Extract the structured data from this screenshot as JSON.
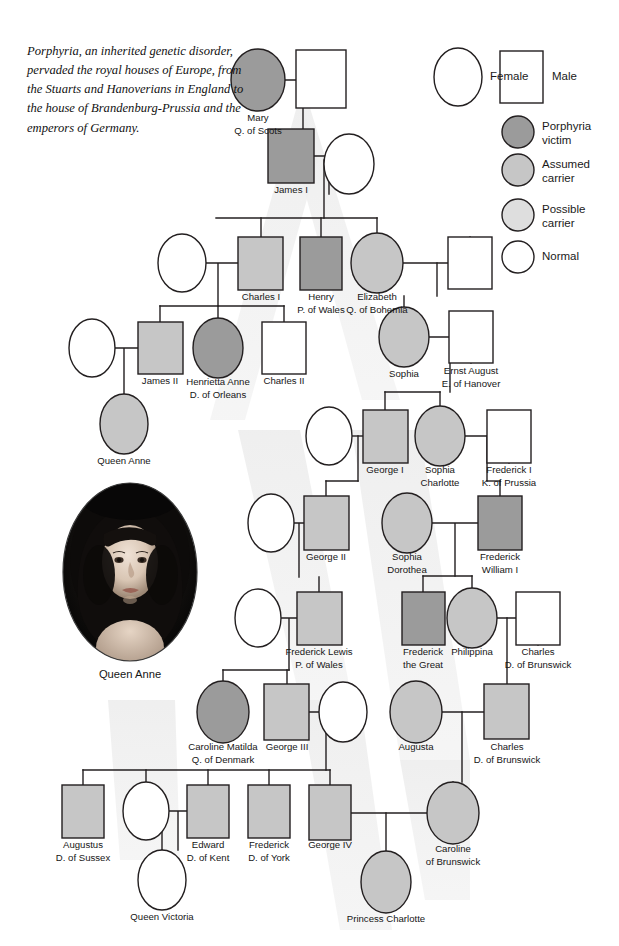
{
  "intro": {
    "text": "Porphyria, an inherited genetic disorder, pervaded the royal houses of Europe, from the Stuarts and Hanoverians in England to the house of Brandenburg-Prussia and the emperors of Germany."
  },
  "legend": {
    "shape_items": [
      {
        "key": "female",
        "label": "Female",
        "shape": "ellipse",
        "fill": "#ffffff"
      },
      {
        "key": "male",
        "label": "Male",
        "shape": "rect",
        "fill": "#ffffff"
      }
    ],
    "status_items": [
      {
        "key": "porphyria-victim",
        "label": "Porphyria\nvictim",
        "fill": "#9b9b9b"
      },
      {
        "key": "assumed-carrier",
        "label": "Assumed\ncarrier",
        "fill": "#c6c6c6"
      },
      {
        "key": "possible-carrier",
        "label": "Possible\ncarrier",
        "fill": "#dedede"
      },
      {
        "key": "normal",
        "label": "Normal",
        "fill": "#ffffff"
      }
    ]
  },
  "colors": {
    "victim": "#9b9b9b",
    "assumed_carrier": "#c6c6c6",
    "possible_carrier": "#dedede",
    "normal": "#ffffff",
    "stroke": "#231f20",
    "watermark": "#eeeeee",
    "text": "#161616"
  },
  "portrait": {
    "name": "queen-anne-portrait",
    "caption": "Queen Anne"
  },
  "people": [
    {
      "id": "mary-q-of-scots",
      "label": "Mary\nQ. of Scots",
      "sex": "female",
      "status": "victim",
      "cx": 258,
      "cy": 80,
      "rx": 27,
      "ry": 31,
      "lx": 258,
      "ly": 112
    },
    {
      "id": "mary-spouse",
      "label": "",
      "sex": "male",
      "status": "normal",
      "x": 296,
      "y": 50,
      "w": 50,
      "h": 58,
      "lx": 321,
      "ly": 110
    },
    {
      "id": "james-i",
      "label": "James I",
      "sex": "male",
      "status": "victim",
      "x": 268,
      "y": 129,
      "w": 46,
      "h": 54,
      "lx": 291,
      "ly": 184
    },
    {
      "id": "james-i-spouse",
      "label": "",
      "sex": "female",
      "status": "normal",
      "cx": 349,
      "cy": 164,
      "rx": 25,
      "ry": 30,
      "lx": 349,
      "ly": 195
    },
    {
      "id": "charles-i",
      "label": "Charles I",
      "sex": "male",
      "status": "assumed_carrier",
      "x": 238,
      "y": 237,
      "w": 45,
      "h": 53,
      "lx": 261,
      "ly": 291
    },
    {
      "id": "charles-i-spouse",
      "label": "",
      "sex": "female",
      "status": "normal",
      "cx": 182,
      "cy": 263,
      "rx": 24,
      "ry": 29,
      "lx": 182,
      "ly": 293
    },
    {
      "id": "henry-p-of-wales",
      "label": "Henry\nP. of Wales",
      "sex": "male",
      "status": "victim",
      "x": 300,
      "y": 237,
      "w": 42,
      "h": 53,
      "lx": 321,
      "ly": 291
    },
    {
      "id": "elizabeth-q-of-bohemia",
      "label": "Elizabeth\nQ. of Bohemia",
      "sex": "female",
      "status": "assumed_carrier",
      "cx": 377,
      "cy": 263,
      "rx": 26,
      "ry": 30,
      "lx": 377,
      "ly": 291
    },
    {
      "id": "elizabeth-spouse",
      "label": "",
      "sex": "male",
      "status": "normal",
      "x": 448,
      "y": 237,
      "w": 44,
      "h": 52,
      "lx": 470,
      "ly": 291
    },
    {
      "id": "james-ii",
      "label": "James II",
      "sex": "male",
      "status": "assumed_carrier",
      "x": 138,
      "y": 322,
      "w": 45,
      "h": 52,
      "lx": 160,
      "ly": 375
    },
    {
      "id": "james-ii-spouse",
      "label": "",
      "sex": "female",
      "status": "normal",
      "cx": 92,
      "cy": 348,
      "rx": 23,
      "ry": 29,
      "lx": 92,
      "ly": 378
    },
    {
      "id": "henrietta-anne-d-of-orleans",
      "label": "Henrietta Anne\nD. of Orleans",
      "sex": "female",
      "status": "victim",
      "cx": 218,
      "cy": 348,
      "rx": 25,
      "ry": 30,
      "lx": 218,
      "ly": 376
    },
    {
      "id": "charles-ii",
      "label": "Charles II",
      "sex": "male",
      "status": "normal",
      "x": 262,
      "y": 322,
      "w": 44,
      "h": 52,
      "lx": 284,
      "ly": 375
    },
    {
      "id": "queen-anne",
      "label": "Queen Anne",
      "sex": "female",
      "status": "assumed_carrier",
      "cx": 124,
      "cy": 424,
      "rx": 24,
      "ry": 30,
      "lx": 124,
      "ly": 455
    },
    {
      "id": "sophia",
      "label": "Sophia",
      "sex": "female",
      "status": "assumed_carrier",
      "cx": 404,
      "cy": 337,
      "rx": 25,
      "ry": 30,
      "lx": 404,
      "ly": 368
    },
    {
      "id": "ernst-august-e-of-hanover",
      "label": "Ernst August\nE. of Hanover",
      "sex": "male",
      "status": "normal",
      "x": 449,
      "y": 311,
      "w": 44,
      "h": 52,
      "lx": 471,
      "ly": 365
    },
    {
      "id": "george-i",
      "label": "George I",
      "sex": "male",
      "status": "assumed_carrier",
      "x": 363,
      "y": 410,
      "w": 45,
      "h": 53,
      "lx": 385,
      "ly": 464
    },
    {
      "id": "george-i-spouse",
      "label": "",
      "sex": "female",
      "status": "normal",
      "cx": 329,
      "cy": 436,
      "rx": 23,
      "ry": 29,
      "lx": 329,
      "ly": 466
    },
    {
      "id": "sophia-charlotte",
      "label": "Sophia\nCharlotte",
      "sex": "female",
      "status": "assumed_carrier",
      "cx": 440,
      "cy": 436,
      "rx": 25,
      "ry": 30,
      "lx": 440,
      "ly": 464
    },
    {
      "id": "frederick-i-k-of-prussia",
      "label": "Frederick I\nK. of Prussia",
      "sex": "male",
      "status": "normal",
      "x": 487,
      "y": 410,
      "w": 44,
      "h": 53,
      "lx": 509,
      "ly": 464
    },
    {
      "id": "george-ii",
      "label": "George II",
      "sex": "male",
      "status": "assumed_carrier",
      "x": 304,
      "y": 496,
      "w": 45,
      "h": 54,
      "lx": 326,
      "ly": 551
    },
    {
      "id": "george-ii-spouse",
      "label": "",
      "sex": "female",
      "status": "normal",
      "cx": 271,
      "cy": 523,
      "rx": 23,
      "ry": 29,
      "lx": 271,
      "ly": 553
    },
    {
      "id": "sophia-dorothea",
      "label": "Sophia\nDorothea",
      "sex": "female",
      "status": "assumed_carrier",
      "cx": 407,
      "cy": 523,
      "rx": 25,
      "ry": 30,
      "lx": 407,
      "ly": 551
    },
    {
      "id": "frederick-william-i",
      "label": "Frederick\nWilliam I",
      "sex": "male",
      "status": "victim",
      "x": 478,
      "y": 496,
      "w": 44,
      "h": 54,
      "lx": 500,
      "ly": 551
    },
    {
      "id": "frederick-lewis-p-of-wales",
      "label": "Frederick Lewis\nP. of Wales",
      "sex": "male",
      "status": "assumed_carrier",
      "x": 297,
      "y": 592,
      "w": 45,
      "h": 53,
      "lx": 319,
      "ly": 646
    },
    {
      "id": "frederick-lewis-spouse",
      "label": "",
      "sex": "female",
      "status": "normal",
      "cx": 258,
      "cy": 618,
      "rx": 23,
      "ry": 29,
      "lx": 258,
      "ly": 648
    },
    {
      "id": "frederick-the-great",
      "label": "Frederick\nthe Great",
      "sex": "male",
      "status": "victim",
      "x": 402,
      "y": 592,
      "w": 43,
      "h": 53,
      "lx": 423,
      "ly": 646
    },
    {
      "id": "philippina",
      "label": "Philippina",
      "sex": "female",
      "status": "assumed_carrier",
      "cx": 472,
      "cy": 618,
      "rx": 25,
      "ry": 30,
      "lx": 472,
      "ly": 646
    },
    {
      "id": "charles-d-of-brunswick-sr",
      "label": "Charles\nD. of Brunswick",
      "sex": "male",
      "status": "normal",
      "x": 516,
      "y": 592,
      "w": 44,
      "h": 53,
      "lx": 538,
      "ly": 646
    },
    {
      "id": "caroline-matilda-q-of-denmark",
      "label": "Caroline Matilda\nQ. of Denmark",
      "sex": "female",
      "status": "victim",
      "cx": 223,
      "cy": 712,
      "rx": 26,
      "ry": 31,
      "lx": 223,
      "ly": 741
    },
    {
      "id": "george-iii",
      "label": "George III",
      "sex": "male",
      "status": "assumed_carrier",
      "x": 264,
      "y": 684,
      "w": 45,
      "h": 56,
      "lx": 287,
      "ly": 741
    },
    {
      "id": "george-iii-spouse",
      "label": "",
      "sex": "female",
      "status": "normal",
      "cx": 343,
      "cy": 712,
      "rx": 24,
      "ry": 30,
      "lx": 343,
      "ly": 743
    },
    {
      "id": "augusta",
      "label": "Augusta",
      "sex": "female",
      "status": "assumed_carrier",
      "cx": 416,
      "cy": 712,
      "rx": 26,
      "ry": 31,
      "lx": 416,
      "ly": 741
    },
    {
      "id": "charles-d-of-brunswick-jr",
      "label": "Charles\nD. of Brunswick",
      "sex": "male",
      "status": "assumed_carrier",
      "x": 484,
      "y": 684,
      "w": 45,
      "h": 55,
      "lx": 507,
      "ly": 741
    },
    {
      "id": "augustus-d-of-sussex",
      "label": "Augustus\nD. of Sussex",
      "sex": "male",
      "status": "assumed_carrier",
      "x": 62,
      "y": 785,
      "w": 42,
      "h": 53,
      "lx": 83,
      "ly": 839
    },
    {
      "id": "edward-d-of-kent-spouse",
      "label": "",
      "sex": "female",
      "status": "normal",
      "cx": 146,
      "cy": 811,
      "rx": 23,
      "ry": 29,
      "lx": 146,
      "ly": 842
    },
    {
      "id": "edward-d-of-kent",
      "label": "Edward\nD. of Kent",
      "sex": "male",
      "status": "assumed_carrier",
      "x": 187,
      "y": 785,
      "w": 42,
      "h": 53,
      "lx": 208,
      "ly": 839
    },
    {
      "id": "frederick-d-of-york",
      "label": "Frederick\nD. of York",
      "sex": "male",
      "status": "assumed_carrier",
      "x": 248,
      "y": 785,
      "w": 42,
      "h": 53,
      "lx": 269,
      "ly": 839
    },
    {
      "id": "george-iv",
      "label": "George IV",
      "sex": "male",
      "status": "assumed_carrier",
      "x": 309,
      "y": 785,
      "w": 42,
      "h": 55,
      "lx": 330,
      "ly": 839
    },
    {
      "id": "caroline-of-brunswick",
      "label": "Caroline\nof Brunswick",
      "sex": "female",
      "status": "assumed_carrier",
      "cx": 453,
      "cy": 813,
      "rx": 26,
      "ry": 31,
      "lx": 453,
      "ly": 843
    },
    {
      "id": "queen-victoria",
      "label": "Queen Victoria",
      "sex": "female",
      "status": "normal",
      "cx": 162,
      "cy": 880,
      "rx": 24,
      "ry": 30,
      "lx": 162,
      "ly": 911
    },
    {
      "id": "princess-charlotte",
      "label": "Princess Charlotte",
      "sex": "female",
      "status": "assumed_carrier",
      "cx": 386,
      "cy": 882,
      "rx": 25,
      "ry": 31,
      "lx": 386,
      "ly": 913
    }
  ],
  "links": [
    {
      "id": "mary-union",
      "d": "M285 80 H321 M321 80 V55"
    },
    {
      "id": "mary-to-james-i",
      "d": "M303 80 V129"
    },
    {
      "id": "james-i-union",
      "d": "M314 156 H329 M329 156 V194"
    },
    {
      "id": "james-i-children-drop",
      "d": "M324 160 V218"
    },
    {
      "id": "gen3-sibship",
      "d": "M216 218 H377"
    },
    {
      "id": "charles-i-stem",
      "d": "M261 218 V237"
    },
    {
      "id": "henry-stem",
      "d": "M321 218 V237"
    },
    {
      "id": "elizabeth-stem",
      "d": "M377 218 V233"
    },
    {
      "id": "charles-i-union",
      "d": "M206 263 H238 M218 263 V306"
    },
    {
      "id": "elizabeth-union",
      "d": "M403 263 H470 M470 263 V237"
    },
    {
      "id": "elizabeth-children-drop",
      "d": "M437 263 V296"
    },
    {
      "id": "sophia-stem",
      "d": "M404 296 V307"
    },
    {
      "id": "gen4-sibship",
      "d": "M160 306 H284"
    },
    {
      "id": "james-ii-stem",
      "d": "M160 306 V322"
    },
    {
      "id": "henrietta-stem",
      "d": "M218 306 V318"
    },
    {
      "id": "charles-ii-stem",
      "d": "M284 306 V322"
    },
    {
      "id": "james-ii-union",
      "d": "M115 348 H138 M124 348 V394"
    },
    {
      "id": "sophia-union",
      "d": "M429 337 H471 M471 337 V363"
    },
    {
      "id": "sophia-children-drop",
      "d": "M450 337 V392"
    },
    {
      "id": "gen5-sibship",
      "d": "M385 392 H440"
    },
    {
      "id": "george-i-stem",
      "d": "M385 392 V410"
    },
    {
      "id": "sophia-charlotte-stem",
      "d": "M440 392 V406"
    },
    {
      "id": "george-i-union",
      "d": "M352 436 H363"
    },
    {
      "id": "george-i-children-drop",
      "d": "M358 436 V481"
    },
    {
      "id": "sophia-charlotte-union",
      "d": "M465 436 H509 M509 436 V463"
    },
    {
      "id": "sc-children-drop",
      "d": "M487 436 V481"
    },
    {
      "id": "george-ii-stem",
      "d": "M326 481 V496"
    },
    {
      "id": "george-ii-sib",
      "d": "M326 481 H358"
    },
    {
      "id": "fw1-stem",
      "d": "M500 481 V496"
    },
    {
      "id": "fw1-sib",
      "d": "M487 481 H500"
    },
    {
      "id": "george-ii-union",
      "d": "M294 523 H304 M299 523 V577"
    },
    {
      "id": "fw1-union",
      "d": "M432 523 H478 M455 523 V576"
    },
    {
      "id": "gen7-prussia-sibship",
      "d": "M423 576 H472"
    },
    {
      "id": "frederick-great-stem",
      "d": "M423 576 V592"
    },
    {
      "id": "philippina-stem",
      "d": "M472 576 V588"
    },
    {
      "id": "frederick-lewis-stem",
      "d": "M319 577 V592"
    },
    {
      "id": "frederick-lewis-union",
      "d": "M281 618 H297 M289 618 V670"
    },
    {
      "id": "charles-sr-union",
      "d": "M497 618 H538 M538 618 V645"
    },
    {
      "id": "charles-jr-drop",
      "d": "M507 618 V684"
    },
    {
      "id": "gen8-sibship",
      "d": "M223 670 H289"
    },
    {
      "id": "caroline-matilda-stem",
      "d": "M223 670 V681"
    },
    {
      "id": "george-iii-stem",
      "d": "M287 670 V684"
    },
    {
      "id": "george-iii-union",
      "d": "M309 712 H343"
    },
    {
      "id": "george-iii-children-drop",
      "d": "M326 712 V770"
    },
    {
      "id": "augusta-union",
      "d": "M442 712 H484"
    },
    {
      "id": "augusta-children-drop",
      "d": "M462 712 V782"
    },
    {
      "id": "gen9-sibship",
      "d": "M83 770 H330"
    },
    {
      "id": "augustus-stem",
      "d": "M83 770 V785"
    },
    {
      "id": "edward-kent-stem",
      "d": "M208 770 V785"
    },
    {
      "id": "victoria-mother-stem",
      "d": "M146 770 V782"
    },
    {
      "id": "frederick-york-stem",
      "d": "M269 770 V785"
    },
    {
      "id": "george-iv-stem",
      "d": "M330 770 V785"
    },
    {
      "id": "caroline-brunswick-stem",
      "d": "M453 782 V782"
    },
    {
      "id": "edward-union",
      "d": "M169 811 H187 M178 811 V850"
    },
    {
      "id": "queen-victoria-stem",
      "d": "M162 850 V850"
    },
    {
      "id": "victoria-drop",
      "d": "M162 811 V850"
    },
    {
      "id": "george-iv-union",
      "d": "M351 813 H427"
    },
    {
      "id": "george-iv-children-drop",
      "d": "M386 813 V851"
    }
  ]
}
